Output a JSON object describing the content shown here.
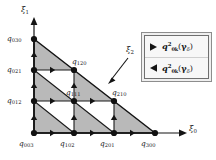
{
  "figure": {
    "kind": "simplex-node-diagram",
    "background_color": "#ffffff",
    "line_color": "#1a1a1a",
    "shaded_fill": "#b9b9b9",
    "unshaded_fill": "#ffffff"
  },
  "axes": {
    "horizontal": {
      "name": "xi-0",
      "label_base": "ξ",
      "label_sub": "0"
    },
    "vertical": {
      "name": "xi-1",
      "label_base": "ξ",
      "label_sub": "1"
    },
    "diagonal": {
      "name": "xi-2",
      "label_base": "ξ",
      "label_sub": "2"
    }
  },
  "nodes": [
    {
      "id": "q003",
      "base": "q",
      "sub": "003",
      "x": 34,
      "y": 133,
      "label_x": 19,
      "label_y": 140
    },
    {
      "id": "q102",
      "base": "q",
      "sub": "102",
      "x": 74,
      "y": 133,
      "label_x": 60,
      "label_y": 140
    },
    {
      "id": "q201",
      "base": "q",
      "sub": "201",
      "x": 114,
      "y": 133,
      "label_x": 100,
      "label_y": 140
    },
    {
      "id": "q300",
      "base": "q",
      "sub": "300",
      "x": 155,
      "y": 133,
      "label_x": 141,
      "label_y": 140
    },
    {
      "id": "q012",
      "base": "q",
      "sub": "012",
      "x": 34,
      "y": 101,
      "label_x": 7,
      "label_y": 97
    },
    {
      "id": "q111",
      "base": "q",
      "sub": "111",
      "x": 74,
      "y": 101,
      "label_x": 66,
      "label_y": 89
    },
    {
      "id": "q210",
      "base": "q",
      "sub": "210",
      "x": 114,
      "y": 101,
      "label_x": 112,
      "label_y": 89
    },
    {
      "id": "q021",
      "base": "q",
      "sub": "021",
      "x": 34,
      "y": 70,
      "label_x": 7,
      "label_y": 66
    },
    {
      "id": "q120",
      "base": "q",
      "sub": "120",
      "x": 74,
      "y": 70,
      "label_x": 72,
      "label_y": 58
    },
    {
      "id": "q030",
      "base": "q",
      "sub": "030",
      "x": 34,
      "y": 39,
      "label_x": 7,
      "label_y": 35
    }
  ],
  "markers": {
    "right_arrow_name": "right-triangle-marker",
    "up_arrow_name": "up-triangle-marker"
  },
  "legend": {
    "entries": [
      {
        "marker": "right-triangle-marker",
        "q": "q",
        "sup": "2",
        "sub": "0k",
        "open": "(",
        "gamma": "γ",
        "gamma_sub": "δ",
        "close": ")"
      },
      {
        "marker": "left-triangle-marker",
        "q": "q",
        "sup": "2",
        "sub": "0k",
        "open": "(",
        "gamma": "γ",
        "gamma_sub": "δ",
        "close": ")"
      }
    ]
  }
}
